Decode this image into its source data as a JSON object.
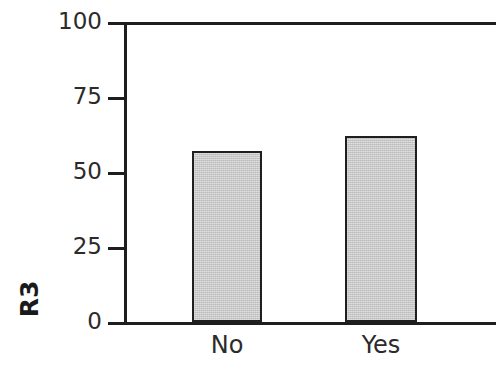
{
  "chart_data": {
    "type": "bar",
    "title": "",
    "xlabel": "",
    "ylabel": "R3",
    "categories": [
      "No",
      "Yes"
    ],
    "values": [
      57,
      62
    ],
    "ylim": [
      0,
      100
    ],
    "yticks": [
      0,
      25,
      50,
      75,
      100
    ],
    "ytick_labels": [
      "0",
      "25",
      "50",
      "75",
      "100"
    ],
    "grid": false,
    "legend": null,
    "bar_fill_color": "#cbcbcb",
    "bar_edge_color": "#1f1f1f",
    "axis_color": "#1e1e1e",
    "background_color": "#ffffff",
    "series": [
      {
        "name": "R3",
        "values": [
          57,
          62
        ]
      }
    ]
  },
  "axis": {
    "ylabel": "R3",
    "ytick_0": "0",
    "ytick_25": "25",
    "ytick_50": "50",
    "ytick_75": "75",
    "ytick_100": "100"
  },
  "categories": {
    "cat_0": "No",
    "cat_1": "Yes"
  }
}
